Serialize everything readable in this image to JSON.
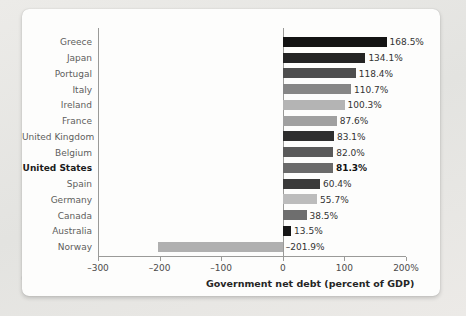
{
  "chart_data": {
    "type": "bar",
    "orientation": "horizontal",
    "title": "",
    "xlabel": "Government net debt (percent of GDP)",
    "ylabel": "",
    "xlim": [
      -300,
      200
    ],
    "xticks": [
      -300,
      -200,
      -100,
      0,
      100,
      200
    ],
    "xtick_labels": [
      "–300",
      "–200",
      "–100",
      "0",
      "100",
      "200%"
    ],
    "grid": false,
    "legend": null,
    "categories": [
      "Greece",
      "Japan",
      "Portugal",
      "Italy",
      "Ireland",
      "France",
      "United Kingdom",
      "Belgium",
      "United States",
      "Spain",
      "Germany",
      "Canada",
      "Australia",
      "Norway"
    ],
    "values": [
      168.5,
      134.1,
      118.4,
      110.7,
      100.3,
      87.6,
      83.1,
      82.0,
      81.3,
      60.4,
      55.7,
      38.5,
      13.5,
      -201.9
    ],
    "value_labels": [
      "168.5%",
      "134.1%",
      "118.4%",
      "110.7%",
      "100.3%",
      "87.6%",
      "83.1%",
      "82.0%",
      "81.3%",
      "60.4%",
      "55.7%",
      "38.5%",
      "13.5%",
      "–201.9%"
    ],
    "bar_colors": [
      "#131313",
      "#242424",
      "#4e4e4e",
      "#868686",
      "#b4b4b4",
      "#a0a0a0",
      "#2e2e2e",
      "#5a5a5a",
      "#6a6a6a",
      "#3a3a3a",
      "#bcbcbc",
      "#6e6e6e",
      "#161616",
      "#b0b0b0"
    ],
    "highlight_category": "United States"
  }
}
